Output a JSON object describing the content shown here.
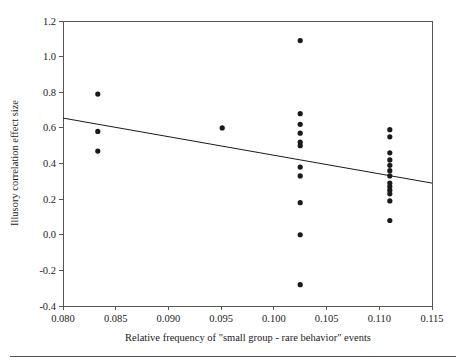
{
  "chart_data": {
    "type": "scatter",
    "title": "",
    "subtitle": "",
    "xlabel": "Relative frequency of \"small group - rare behavior\" events",
    "ylabel": "Illusory correlation effect size",
    "xlim": [
      0.08,
      0.115
    ],
    "ylim": [
      -0.4,
      1.2
    ],
    "xticks": [
      0.08,
      0.085,
      0.09,
      0.095,
      0.1,
      0.105,
      0.11,
      0.115
    ],
    "yticks": [
      -0.4,
      -0.2,
      0.0,
      0.2,
      0.4,
      0.6,
      0.8,
      1.0,
      1.2
    ],
    "xtick_labels": [
      "0.080",
      "0.085",
      "0.090",
      "0.095",
      "0.100",
      "0.105",
      "0.110",
      "0.115"
    ],
    "ytick_labels": [
      "-0.4",
      "-0.2",
      "0.0",
      "0.2",
      "0.4",
      "0.6",
      "0.8",
      "1.0",
      "1.2"
    ],
    "grid": false,
    "legend": null,
    "legend_position": "none",
    "marker_color": "#1a1a1a",
    "marker_size": 4,
    "trendline": {
      "type": "linear",
      "color": "#1a1a1a",
      "x_start": 0.08,
      "y_start": 0.655,
      "x_end": 0.115,
      "y_end": 0.29
    },
    "points": [
      {
        "x": 0.0833,
        "y": 0.79
      },
      {
        "x": 0.0833,
        "y": 0.58
      },
      {
        "x": 0.0833,
        "y": 0.47
      },
      {
        "x": 0.0951,
        "y": 0.6
      },
      {
        "x": 0.1025,
        "y": 1.09
      },
      {
        "x": 0.1025,
        "y": 0.68
      },
      {
        "x": 0.1025,
        "y": 0.62
      },
      {
        "x": 0.1025,
        "y": 0.57
      },
      {
        "x": 0.1025,
        "y": 0.52
      },
      {
        "x": 0.1025,
        "y": 0.5
      },
      {
        "x": 0.1025,
        "y": 0.38
      },
      {
        "x": 0.1025,
        "y": 0.33
      },
      {
        "x": 0.1025,
        "y": 0.18
      },
      {
        "x": 0.1025,
        "y": 0.0
      },
      {
        "x": 0.1025,
        "y": -0.28
      },
      {
        "x": 0.111,
        "y": 0.59
      },
      {
        "x": 0.111,
        "y": 0.55
      },
      {
        "x": 0.111,
        "y": 0.46
      },
      {
        "x": 0.111,
        "y": 0.42
      },
      {
        "x": 0.111,
        "y": 0.39
      },
      {
        "x": 0.111,
        "y": 0.36
      },
      {
        "x": 0.111,
        "y": 0.33
      },
      {
        "x": 0.111,
        "y": 0.29
      },
      {
        "x": 0.111,
        "y": 0.27
      },
      {
        "x": 0.111,
        "y": 0.25
      },
      {
        "x": 0.111,
        "y": 0.23
      },
      {
        "x": 0.111,
        "y": 0.19
      },
      {
        "x": 0.111,
        "y": 0.08
      }
    ]
  },
  "figure": {
    "background_color": "#ffffff",
    "axis_color": "#555555",
    "has_footer_rule": true
  }
}
